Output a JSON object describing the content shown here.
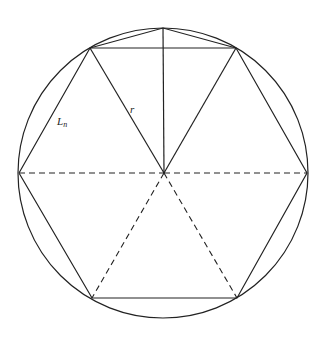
{
  "diagram": {
    "type": "inscribed-regular-hexagon",
    "labels": {
      "side": "L",
      "side_subscript": "n",
      "radius": "r"
    },
    "geometry": {
      "circle": {
        "cx": 163,
        "cy": 173,
        "r": 145
      },
      "center": [
        164,
        173
      ],
      "hexagon_vertices": [
        [
          90,
          48
        ],
        [
          236,
          48
        ],
        [
          307,
          173
        ],
        [
          237,
          298
        ],
        [
          92,
          298
        ],
        [
          19,
          173
        ]
      ],
      "arc_midpoint_top": [
        163,
        28
      ]
    },
    "colors": {
      "stroke": "#222222",
      "background": "#ffffff"
    }
  }
}
